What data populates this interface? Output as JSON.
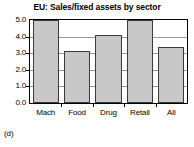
{
  "figure": {
    "caption": "(d)",
    "background": "#ffffff"
  },
  "chart_data": {
    "type": "bar",
    "title": "EU: Sales/fixed assets by sector",
    "xlabel": "",
    "ylabel": "",
    "categories": [
      "Mach",
      "Food",
      "Drug",
      "Retail",
      "All"
    ],
    "values": [
      5.0,
      3.15,
      4.1,
      5.0,
      3.4
    ],
    "ylim": [
      0.0,
      5.0
    ],
    "ytick_labels": [
      "0.0",
      "1.0",
      "2.0",
      "3.0",
      "4.0",
      "5.0"
    ],
    "ytick_values": [
      0.0,
      1.0,
      2.0,
      3.0,
      4.0,
      5.0
    ],
    "grid": true,
    "legend": false,
    "legend_position": "none",
    "bar_color": "#c8c8c8",
    "bar_edge_color": "#3b3b3b",
    "grid_color": "#9a9a9a",
    "axis_color": "#000000"
  }
}
